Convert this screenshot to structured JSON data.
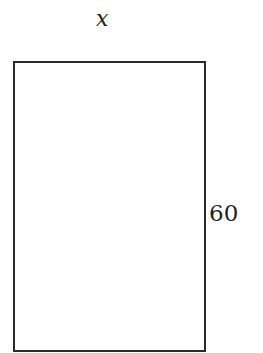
{
  "diagram": {
    "shape": "rectangle",
    "top_label": "x",
    "right_label": "60",
    "stroke_color": "#2a2a2a"
  }
}
